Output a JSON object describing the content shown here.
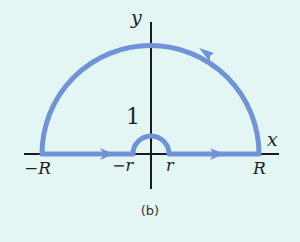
{
  "diagram": {
    "caption": "(b)",
    "colors": {
      "background": "#e4f6f4",
      "contour": "#6f93d6",
      "axes": "#1a1a1a"
    },
    "axes": {
      "x_label": "x",
      "y_label": "y"
    },
    "labels": {
      "neg_R": "−R",
      "neg_r": "−r",
      "r": "r",
      "R": "R",
      "one": "1"
    },
    "contour": {
      "description": "Indented semicircular contour in upper half-plane: segment from -R to -r, small semicircle of radius r over origin, segment from r to R, large semicircle of radius R back to -R",
      "direction": "counterclockwise"
    }
  }
}
